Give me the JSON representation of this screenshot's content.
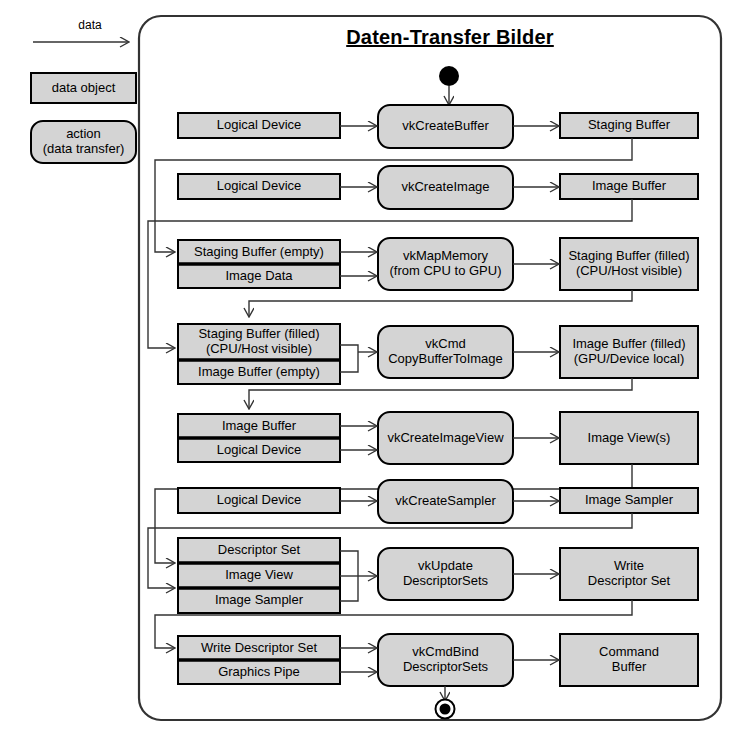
{
  "canvas": {
    "width": 734,
    "height": 746
  },
  "colors": {
    "fill_gray": "#d4d4d4",
    "fill_gray_light": "#dcdcdc",
    "stroke": "#000000",
    "line": "#333333",
    "background": "#ffffff"
  },
  "legend": {
    "arrow_label": "data",
    "data_object_label": "data object",
    "action_label_line1": "action",
    "action_label_line2": "(data transfer)"
  },
  "frame": {
    "title": "Daten-Transfer Bilder",
    "start_node": "filled-circle",
    "end_node": "bullseye-circle"
  },
  "rows": [
    {
      "id": "create-buffer",
      "inputs": [
        "Logical Device"
      ],
      "action": "vkCreateBuffer",
      "output": "Staging Buffer"
    },
    {
      "id": "create-image",
      "inputs": [
        "Logical Device"
      ],
      "action": "vkCreateImage",
      "output": "Image Buffer"
    },
    {
      "id": "map-memory",
      "inputs": [
        "Staging Buffer (empty)",
        "Image Data"
      ],
      "action": "vkMapMemory\n(from CPU to GPU)",
      "output": "Staging Buffer (filled)\n(CPU/Host visible)"
    },
    {
      "id": "copy-buffer-to-image",
      "inputs": [
        "Staging Buffer (filled)\n(CPU/Host visible)",
        "Image Buffer (empty)"
      ],
      "action": "vkCmd\nCopyBufferToImage",
      "output": "Image Buffer (filled)\n(GPU/Device local)"
    },
    {
      "id": "create-image-view",
      "inputs": [
        "Image Buffer",
        "Logical Device"
      ],
      "action": "vkCreateImageView",
      "output": "Image View(s)"
    },
    {
      "id": "create-sampler",
      "inputs": [
        "Logical Device"
      ],
      "action": "vkCreateSampler",
      "output": "Image Sampler"
    },
    {
      "id": "update-descriptor-sets",
      "inputs": [
        "Descriptor Set",
        "Image View",
        "Image Sampler"
      ],
      "action": "vkUpdate\nDescriptorSets",
      "output": "Write\nDescriptor Set"
    },
    {
      "id": "bind-descriptor-sets",
      "inputs": [
        "Write Descriptor Set",
        "Graphics Pipe"
      ],
      "action": "vkCmdBind\nDescriptorSets",
      "output": "Command\nBuffer"
    }
  ]
}
